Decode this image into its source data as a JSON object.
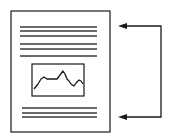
{
  "diagram": {
    "colors": {
      "background": "#ffffff",
      "stroke": "#1a1a1a",
      "text_lines": "#3a3a3a"
    },
    "page": {
      "x": 11,
      "y": 11,
      "width": 99,
      "height": 121
    },
    "top_text_lines": [
      {
        "y": 27,
        "x1": 20,
        "x2": 97
      },
      {
        "y": 31,
        "x1": 20,
        "x2": 97
      },
      {
        "y": 36,
        "x1": 20,
        "x2": 97
      },
      {
        "y": 44,
        "x1": 20,
        "x2": 97
      },
      {
        "y": 49,
        "x1": 20,
        "x2": 97
      },
      {
        "y": 56,
        "x1": 20,
        "x2": 97
      }
    ],
    "embedded_chart": {
      "x": 32,
      "y": 64,
      "width": 52,
      "height": 32,
      "points": "34,89 38,84 41,79 44,77 47,79 52,79 57,79 60,75 63,71 65,74 67,79 69,81 71,84 74,86 76,83 79,80 81,81 83,84"
    },
    "bottom_text_lines": [
      {
        "y": 108,
        "x1": 22,
        "x2": 97
      },
      {
        "y": 113,
        "x1": 22,
        "x2": 97
      },
      {
        "y": 117,
        "x1": 22,
        "x2": 97
      }
    ],
    "bracket_arrow": {
      "top_y": 26,
      "bottom_y": 117,
      "vertical_x": 161,
      "arrow_tip_x": 118,
      "arrow_head_length": 9,
      "arrow_head_half_width": 3
    }
  }
}
